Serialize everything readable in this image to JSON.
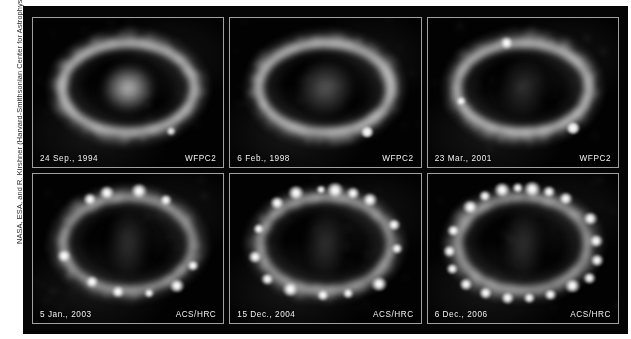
{
  "figure": {
    "credit": "NASA, ESA, and R. Kirshner (Harvard-Smithsonian Center for Astrophysics)",
    "background_color": "#ffffff",
    "frame_color": "#050505",
    "panel_border_color": "#9fa0a2",
    "caption_text_color": "#f2f2f2"
  },
  "panels": [
    {
      "id": "panel-1994",
      "date": "24 Sep., 1994",
      "instrument": "WFPC2",
      "row": 1,
      "column": 1,
      "core_style": "core-bright",
      "ring_style": "ring-wfpc2",
      "hotspot_count": 0,
      "field_star_count": 1
    },
    {
      "id": "panel-1998",
      "date": "6 Feb., 1998",
      "instrument": "WFPC2",
      "row": 1,
      "column": 2,
      "core_style": "core-mid",
      "ring_style": "ring-wfpc2",
      "hotspot_count": 1,
      "field_star_count": 1
    },
    {
      "id": "panel-2001",
      "date": "23 Mar., 2001",
      "instrument": "WFPC2",
      "row": 1,
      "column": 3,
      "core_style": "core-faint",
      "ring_style": "ring-wfpc2",
      "hotspot_count": 3,
      "field_star_count": 1
    },
    {
      "id": "panel-2003",
      "date": "5 Jan., 2003",
      "instrument": "ACS/HRC",
      "row": 2,
      "column": 1,
      "core_style": "core-elong",
      "ring_style": "ring-acs",
      "hotspot_count": 10,
      "field_star_count": 0
    },
    {
      "id": "panel-2004",
      "date": "15 Dec., 2004",
      "instrument": "ACS/HRC",
      "row": 2,
      "column": 2,
      "core_style": "core-elong",
      "ring_style": "ring-acs",
      "hotspot_count": 15,
      "field_star_count": 0
    },
    {
      "id": "panel-2006",
      "date": "6 Dec., 2006",
      "instrument": "ACS/HRC",
      "row": 2,
      "column": 3,
      "core_style": "core-elong",
      "ring_style": "ring-acs",
      "hotspot_count": 20,
      "field_star_count": 0
    }
  ],
  "hotspot_layouts": {
    "panel-1994": [],
    "panel-1998": [
      {
        "cx": 72.0,
        "cy": 76.5,
        "r": 3.4
      }
    ],
    "panel-2001": [
      {
        "cx": 41.5,
        "cy": 17.0,
        "r": 3.6
      },
      {
        "cx": 17.5,
        "cy": 56.0,
        "r": 2.6
      },
      {
        "cx": 76.5,
        "cy": 74.0,
        "r": 3.6
      }
    ],
    "panel-2003": [
      {
        "cx": 30.0,
        "cy": 17.0,
        "r": 3.4
      },
      {
        "cx": 39.0,
        "cy": 12.5,
        "r": 4.0
      },
      {
        "cx": 55.5,
        "cy": 11.5,
        "r": 4.2
      },
      {
        "cx": 70.0,
        "cy": 17.5,
        "r": 3.2
      },
      {
        "cx": 16.5,
        "cy": 55.0,
        "r": 3.6
      },
      {
        "cx": 84.0,
        "cy": 61.5,
        "r": 3.2
      },
      {
        "cx": 31.0,
        "cy": 72.5,
        "r": 3.4
      },
      {
        "cx": 44.5,
        "cy": 79.0,
        "r": 3.4
      },
      {
        "cx": 75.5,
        "cy": 75.0,
        "r": 4.0
      },
      {
        "cx": 61.0,
        "cy": 80.0,
        "r": 2.6
      }
    ],
    "panel-2004": [
      {
        "cx": 24.5,
        "cy": 19.5,
        "r": 3.6
      },
      {
        "cx": 34.5,
        "cy": 12.5,
        "r": 4.2
      },
      {
        "cx": 47.5,
        "cy": 10.5,
        "r": 2.6
      },
      {
        "cx": 55.0,
        "cy": 11.0,
        "r": 4.4
      },
      {
        "cx": 64.5,
        "cy": 13.0,
        "r": 3.4
      },
      {
        "cx": 73.5,
        "cy": 17.5,
        "r": 4.0
      },
      {
        "cx": 15.0,
        "cy": 37.0,
        "r": 3.0
      },
      {
        "cx": 86.0,
        "cy": 34.0,
        "r": 3.4
      },
      {
        "cx": 13.0,
        "cy": 55.5,
        "r": 3.6
      },
      {
        "cx": 87.5,
        "cy": 50.0,
        "r": 3.2
      },
      {
        "cx": 19.5,
        "cy": 70.5,
        "r": 3.2
      },
      {
        "cx": 31.5,
        "cy": 77.5,
        "r": 4.0
      },
      {
        "cx": 48.5,
        "cy": 81.5,
        "r": 3.2
      },
      {
        "cx": 62.0,
        "cy": 80.0,
        "r": 2.8
      },
      {
        "cx": 78.0,
        "cy": 73.5,
        "r": 4.2
      }
    ],
    "panel-2006": [
      {
        "cx": 22.5,
        "cy": 22.0,
        "r": 3.8
      },
      {
        "cx": 30.0,
        "cy": 15.0,
        "r": 3.2
      },
      {
        "cx": 39.0,
        "cy": 11.0,
        "r": 4.2
      },
      {
        "cx": 47.5,
        "cy": 9.5,
        "r": 3.0
      },
      {
        "cx": 55.0,
        "cy": 10.0,
        "r": 4.4
      },
      {
        "cx": 64.0,
        "cy": 12.0,
        "r": 3.4
      },
      {
        "cx": 72.5,
        "cy": 16.5,
        "r": 3.8
      },
      {
        "cx": 13.5,
        "cy": 38.0,
        "r": 3.2
      },
      {
        "cx": 85.5,
        "cy": 30.0,
        "r": 3.8
      },
      {
        "cx": 11.5,
        "cy": 52.0,
        "r": 3.4
      },
      {
        "cx": 88.5,
        "cy": 45.0,
        "r": 3.6
      },
      {
        "cx": 13.0,
        "cy": 64.0,
        "r": 3.0
      },
      {
        "cx": 89.0,
        "cy": 58.0,
        "r": 3.4
      },
      {
        "cx": 20.0,
        "cy": 74.0,
        "r": 3.4
      },
      {
        "cx": 85.0,
        "cy": 70.0,
        "r": 3.2
      },
      {
        "cx": 30.5,
        "cy": 80.0,
        "r": 3.6
      },
      {
        "cx": 42.0,
        "cy": 83.0,
        "r": 3.6
      },
      {
        "cx": 53.5,
        "cy": 83.5,
        "r": 3.0
      },
      {
        "cx": 64.5,
        "cy": 81.0,
        "r": 3.2
      },
      {
        "cx": 76.0,
        "cy": 75.0,
        "r": 4.0
      }
    ]
  },
  "field_star_layouts": {
    "panel-1994": [
      {
        "cx": 72.5,
        "cy": 76.0,
        "r": 2.6
      }
    ],
    "panel-1998": [
      {
        "cx": 72.0,
        "cy": 76.5,
        "r": 3.0
      }
    ],
    "panel-2001": [
      {
        "cx": 76.5,
        "cy": 74.0,
        "r": 3.2
      }
    ],
    "panel-2003": [],
    "panel-2004": [],
    "panel-2006": []
  }
}
